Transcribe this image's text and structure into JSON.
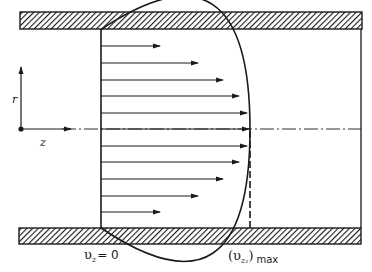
{
  "figure": {
    "title": "",
    "labels": {
      "r_axis": "r",
      "z_axis": "z",
      "wall_velocity_main": "υ",
      "wall_velocity_sub": "z",
      "wall_velocity_eq": "= 0",
      "max_velocity_open": "(υ",
      "max_velocity_sub": "z₁",
      "max_velocity_close": ")",
      "max_velocity_suffix": "max"
    },
    "colors": {
      "line": "#1a1a1a",
      "background": "#ffffff"
    },
    "profile": {
      "shape": "parabolic",
      "arrow_count": 11,
      "description": "Laminar (parabolic) velocity profile in a pipe: zero at walls, maximum at centerline"
    }
  }
}
